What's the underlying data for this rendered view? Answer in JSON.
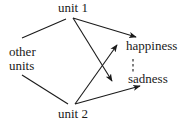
{
  "diagram": {
    "nodes": {
      "unit1": {
        "label": "unit 1"
      },
      "unit2": {
        "label": "unit 2"
      },
      "other": {
        "line1": "other",
        "line2": "units"
      },
      "happiness": {
        "label": "happiness"
      },
      "sadness": {
        "label": "sadness"
      }
    },
    "edges": [
      {
        "from": "other units",
        "to": "unit 1",
        "type": "undirected"
      },
      {
        "from": "other units",
        "to": "unit 2",
        "type": "undirected"
      },
      {
        "from": "unit 1",
        "to": "happiness",
        "type": "arrow"
      },
      {
        "from": "unit 1",
        "to": "sadness",
        "type": "arrow"
      },
      {
        "from": "unit 2",
        "to": "happiness",
        "type": "arrow"
      },
      {
        "from": "unit 2",
        "to": "sadness",
        "type": "arrow"
      },
      {
        "from": "happiness",
        "to": "sadness",
        "type": "dashed"
      }
    ],
    "colors": {
      "stroke": "#1a1a1a",
      "background": "#ffffff"
    }
  }
}
